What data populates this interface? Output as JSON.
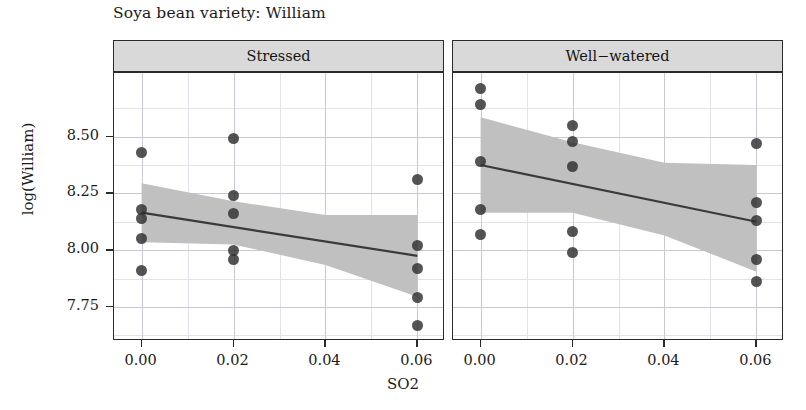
{
  "chart_data": {
    "type": "scatter",
    "title": "Soya bean variety: William",
    "xlabel": "SO2",
    "ylabel": "log(William)",
    "grid": true,
    "legend": false,
    "xlim": [
      -0.006,
      0.066
    ],
    "ylim": [
      7.6,
      8.78
    ],
    "xticks": [
      "0.00",
      "0.02",
      "0.04",
      "0.06"
    ],
    "xtick_values": [
      0.0,
      0.02,
      0.04,
      0.06
    ],
    "yticks": [
      "7.75",
      "8.00",
      "8.25",
      "8.50"
    ],
    "ytick_values": [
      7.75,
      8.0,
      8.25,
      8.5
    ],
    "facets": [
      {
        "label": "Stressed",
        "points": [
          {
            "x": 0.0,
            "y": 8.43
          },
          {
            "x": 0.0,
            "y": 8.18
          },
          {
            "x": 0.0,
            "y": 8.14
          },
          {
            "x": 0.0,
            "y": 8.05
          },
          {
            "x": 0.0,
            "y": 7.91
          },
          {
            "x": 0.02,
            "y": 8.49
          },
          {
            "x": 0.02,
            "y": 8.24
          },
          {
            "x": 0.02,
            "y": 8.16
          },
          {
            "x": 0.02,
            "y": 8.0
          },
          {
            "x": 0.02,
            "y": 7.96
          },
          {
            "x": 0.06,
            "y": 8.31
          },
          {
            "x": 0.06,
            "y": 8.02
          },
          {
            "x": 0.06,
            "y": 7.92
          },
          {
            "x": 0.06,
            "y": 7.79
          },
          {
            "x": 0.06,
            "y": 7.67
          }
        ],
        "fit": {
          "x0": 0.0,
          "y0": 8.165,
          "x1": 0.06,
          "y1": 7.975
        },
        "ribbon_upper": [
          {
            "x": 0.0,
            "y": 8.295
          },
          {
            "x": 0.02,
            "y": 8.215
          },
          {
            "x": 0.04,
            "y": 8.155
          },
          {
            "x": 0.06,
            "y": 8.155
          }
        ],
        "ribbon_lower": [
          {
            "x": 0.0,
            "y": 8.035
          },
          {
            "x": 0.02,
            "y": 8.025
          },
          {
            "x": 0.04,
            "y": 7.935
          },
          {
            "x": 0.06,
            "y": 7.795
          }
        ]
      },
      {
        "label": "Well−watered",
        "points": [
          {
            "x": 0.0,
            "y": 8.71
          },
          {
            "x": 0.0,
            "y": 8.64
          },
          {
            "x": 0.0,
            "y": 8.39
          },
          {
            "x": 0.0,
            "y": 8.18
          },
          {
            "x": 0.0,
            "y": 8.07
          },
          {
            "x": 0.02,
            "y": 8.55
          },
          {
            "x": 0.02,
            "y": 8.48
          },
          {
            "x": 0.02,
            "y": 8.37
          },
          {
            "x": 0.02,
            "y": 8.08
          },
          {
            "x": 0.02,
            "y": 7.99
          },
          {
            "x": 0.06,
            "y": 8.47
          },
          {
            "x": 0.06,
            "y": 8.21
          },
          {
            "x": 0.06,
            "y": 8.13
          },
          {
            "x": 0.06,
            "y": 7.96
          },
          {
            "x": 0.06,
            "y": 7.86
          }
        ],
        "fit": {
          "x0": 0.0,
          "y0": 8.375,
          "x1": 0.06,
          "y1": 8.125
        },
        "ribbon_upper": [
          {
            "x": 0.0,
            "y": 8.585
          },
          {
            "x": 0.02,
            "y": 8.475
          },
          {
            "x": 0.04,
            "y": 8.385
          },
          {
            "x": 0.06,
            "y": 8.375
          }
        ],
        "ribbon_lower": [
          {
            "x": 0.0,
            "y": 8.165
          },
          {
            "x": 0.02,
            "y": 8.165
          },
          {
            "x": 0.04,
            "y": 8.065
          },
          {
            "x": 0.06,
            "y": 7.905
          }
        ]
      }
    ],
    "colors": {
      "point": "#2e2e2e",
      "line": "#3a3a3a",
      "ribbon": "#c0c0c0",
      "strip_fill": "#d9d9d9",
      "panel_border": "#2b2b2b",
      "grid_major": "#c9c9d6",
      "grid_minor": "#e2e2ec"
    }
  }
}
